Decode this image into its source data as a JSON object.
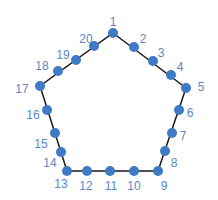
{
  "diagram": {
    "shape": "pentagon",
    "line_color": "#1a1a1a",
    "point_color": "#3f7ac4",
    "label_color": "#5b87c5",
    "outline": [
      [
        113,
        33
      ],
      [
        186,
        88
      ],
      [
        158,
        171
      ],
      [
        67,
        171
      ],
      [
        40,
        86
      ]
    ],
    "points": [
      {
        "label": "1",
        "x": 113,
        "y": 33,
        "lx": 113,
        "ly": 23
      },
      {
        "label": "2",
        "x": 134,
        "y": 47,
        "lx": 143,
        "ly": 40
      },
      {
        "label": "3",
        "x": 153,
        "y": 61,
        "lx": 161,
        "ly": 54
      },
      {
        "label": "4",
        "x": 171,
        "y": 75,
        "lx": 180,
        "ly": 68
      },
      {
        "label": "5",
        "x": 186,
        "y": 88,
        "lx": 201,
        "ly": 88
      },
      {
        "label": "6",
        "x": 179,
        "y": 110,
        "lx": 190,
        "ly": 114
      },
      {
        "label": "7",
        "x": 172,
        "y": 133,
        "lx": 183,
        "ly": 137
      },
      {
        "label": "8",
        "x": 165,
        "y": 151,
        "lx": 174,
        "ly": 164
      },
      {
        "label": "9",
        "x": 158,
        "y": 171,
        "lx": 164,
        "ly": 187
      },
      {
        "label": "10",
        "x": 134,
        "y": 171,
        "lx": 134,
        "ly": 187
      },
      {
        "label": "11",
        "x": 110,
        "y": 171,
        "lx": 111,
        "ly": 187
      },
      {
        "label": "12",
        "x": 87,
        "y": 171,
        "lx": 86,
        "ly": 187
      },
      {
        "label": "13",
        "x": 67,
        "y": 171,
        "lx": 61,
        "ly": 185
      },
      {
        "label": "14",
        "x": 61,
        "y": 152,
        "lx": 50,
        "ly": 164
      },
      {
        "label": "15",
        "x": 55,
        "y": 133,
        "lx": 41,
        "ly": 145
      },
      {
        "label": "16",
        "x": 47,
        "y": 110,
        "lx": 33,
        "ly": 116
      },
      {
        "label": "17",
        "x": 40,
        "y": 86,
        "lx": 22,
        "ly": 90
      },
      {
        "label": "18",
        "x": 58,
        "y": 71,
        "lx": 42,
        "ly": 67
      },
      {
        "label": "19",
        "x": 76,
        "y": 60,
        "lx": 63,
        "ly": 56
      },
      {
        "label": "20",
        "x": 94,
        "y": 46,
        "lx": 86,
        "ly": 40
      }
    ]
  }
}
